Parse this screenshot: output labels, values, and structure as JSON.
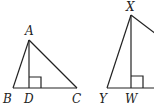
{
  "diagram": {
    "type": "geometry-figure",
    "figures": [
      {
        "name": "triangle-ABC",
        "vertices": {
          "A": [
            29,
            40
          ],
          "B": [
            13,
            88
          ],
          "C": [
            77,
            88
          ]
        },
        "altitude": {
          "from": "A",
          "foot": "D",
          "foot_point": [
            29,
            88
          ],
          "right_angle": true
        },
        "labels": {
          "A": "A",
          "B": "B",
          "C": "C",
          "D": "D"
        }
      },
      {
        "name": "triangle-XYW",
        "vertices": {
          "X": [
            131,
            15
          ],
          "Y": [
            107,
            88
          ]
        },
        "altitude": {
          "from": "X",
          "foot": "W",
          "foot_point": [
            131,
            88
          ],
          "right_angle": true
        },
        "labels": {
          "X": "X",
          "Y": "Y",
          "W": "W"
        }
      }
    ],
    "colors": {
      "stroke": "#222222",
      "background": "#ffffff"
    }
  }
}
